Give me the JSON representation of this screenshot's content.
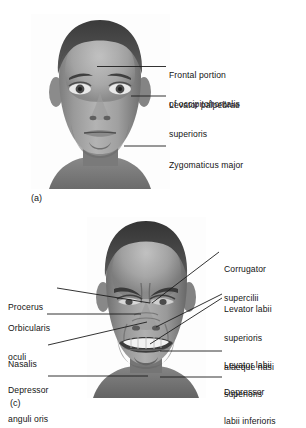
{
  "figure": {
    "panels": [
      {
        "caption": "(a)",
        "photo_alt": "relaxed-face-photograph",
        "labels": [
          {
            "id": "frontal-portion-of-occipitofrontalis",
            "lines": [
              "Frontal portion",
              "of occipitofrontalis"
            ]
          },
          {
            "id": "levator-palpebrae-superioris",
            "lines": [
              "Levator palpebrae",
              "superioris"
            ]
          },
          {
            "id": "zygomaticus-major",
            "lines": [
              "Zygomaticus major"
            ]
          }
        ]
      },
      {
        "caption": "(c)",
        "photo_alt": "grimacing-face-photograph",
        "labels": [
          {
            "id": "procerus",
            "lines": [
              "Procerus"
            ]
          },
          {
            "id": "orbicularis-oculi",
            "lines": [
              "Orbicularis",
              "oculi"
            ]
          },
          {
            "id": "nasalis",
            "lines": [
              "Nasalis"
            ]
          },
          {
            "id": "depressor-anguli-oris",
            "lines": [
              "Depressor",
              "anguli oris"
            ]
          },
          {
            "id": "corrugator-supercilii",
            "lines": [
              "Corrugator",
              "supercilii"
            ]
          },
          {
            "id": "levator-labii-superioris-alaeque-nasi",
            "lines": [
              "Levator labii",
              "superioris",
              "alaeque nasi"
            ]
          },
          {
            "id": "levator-labii-superioris",
            "lines": [
              "Levator labii",
              "superioris"
            ]
          },
          {
            "id": "depressor-labii-inferioris",
            "lines": [
              "Depressor",
              "labii inferioris"
            ]
          }
        ]
      }
    ]
  },
  "panel_a": {
    "caption": "(a)",
    "label_frontal_line1": "Frontal portion",
    "label_frontal_line2": "of occipitofrontalis",
    "label_levator_line1": "Levator palpebrae",
    "label_levator_line2": "superioris",
    "label_zygomaticus": "Zygomaticus major"
  },
  "panel_c": {
    "caption": "(c)",
    "label_procerus": "Procerus",
    "label_orbicularis_line1": "Orbicularis",
    "label_orbicularis_line2": "oculi",
    "label_nasalis": "Nasalis",
    "label_depressor_anguli_line1": "Depressor",
    "label_depressor_anguli_line2": "anguli oris",
    "label_corrugator_line1": "Corrugator",
    "label_corrugator_line2": "supercilii",
    "label_lls_alaeque_line1": "Levator labii",
    "label_lls_alaeque_line2": "superioris",
    "label_lls_alaeque_line3": "alaeque nasi",
    "label_lls_line1": "Levator labii",
    "label_lls_line2": "superioris",
    "label_depressor_labii_line1": "Depressor",
    "label_depressor_labii_line2": "labii inferioris"
  },
  "colors": {
    "text": "#141414",
    "leader_line": "#1c1c1c",
    "background": "#ffffff"
  }
}
